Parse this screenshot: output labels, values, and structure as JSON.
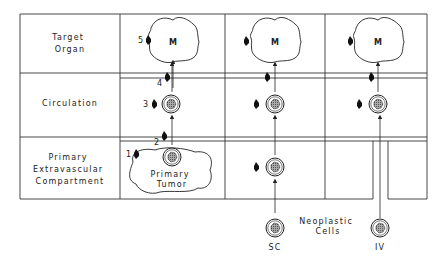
{
  "row_labels": {
    "target": [
      "Target",
      "Organ"
    ],
    "circulation": "Circulation",
    "primary": [
      "Primary",
      "Extravascular",
      "Compartment"
    ]
  },
  "metastasis_label": "M",
  "tumor_label": [
    "Primary",
    "Tumor"
  ],
  "steps": [
    "1",
    "2",
    "3",
    "4",
    "5"
  ],
  "neoplastic_label": [
    "Neoplastic",
    "Cells"
  ],
  "routes": {
    "sc": "SC",
    "iv": "IV"
  },
  "colors": {
    "ink": "#222222",
    "cell_fill": "#8a8a8a",
    "background": "#ffffff"
  }
}
